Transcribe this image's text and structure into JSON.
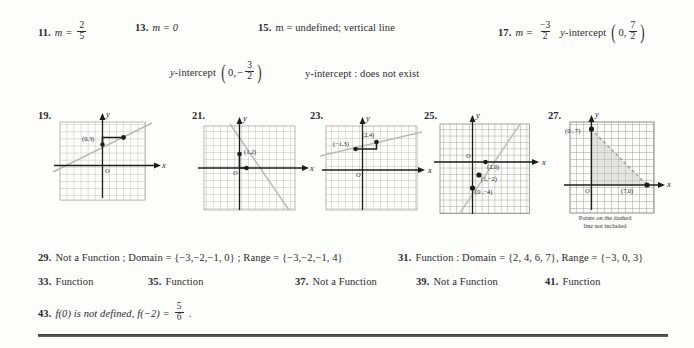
{
  "answers": {
    "row1": [
      {
        "number": "11.",
        "prefix": "m =",
        "frac": {
          "num": "2",
          "den": "5"
        }
      },
      {
        "number": "13.",
        "text": "m = 0"
      },
      {
        "number": "15.",
        "text": "m = undefined; vertical line"
      },
      {
        "number": "17.",
        "prefix": "m =",
        "frac": {
          "num": "−3",
          "den": "2"
        },
        "suffix": "y-intercept",
        "pair": {
          "x": "0,",
          "fracnum": "7",
          "fracden": "2"
        }
      }
    ],
    "row2": [
      {
        "label": "y-intercept",
        "pair": {
          "x": "0,",
          "sign": "−",
          "fracnum": "3",
          "fracden": "2"
        }
      },
      {
        "text": "y-intercept : does not exist"
      }
    ],
    "row3": [
      {
        "number": "29.",
        "text": "Not a Function ; Domain = {−3,−2,−1, 0} ; Range = {−3,−2,−1, 4}"
      },
      {
        "number": "31.",
        "text": "Function : Domain = {2, 4, 6, 7},  Range = {−3, 0, 3}"
      }
    ],
    "row4": [
      {
        "number": "33.",
        "text": "Function"
      },
      {
        "number": "35.",
        "text": "Function"
      },
      {
        "number": "37.",
        "text": "Not a Function"
      },
      {
        "number": "39.",
        "text": "Not a Function"
      },
      {
        "number": "41.",
        "text": "Function"
      }
    ],
    "row5": [
      {
        "number": "43.",
        "prefix": "f(0)  is not defined,   f(−2) =",
        "frac": {
          "num": "5",
          "den": "6"
        },
        "suffix": "."
      }
    ]
  },
  "graphs": [
    {
      "number": "19.",
      "x_axis_label": "x",
      "y_axis_label": "y",
      "origin_label": "O",
      "point_labels": [
        "(0,3)"
      ],
      "line_style": "solid",
      "shaded": false,
      "caption": ""
    },
    {
      "number": "21.",
      "x_axis_label": "x",
      "y_axis_label": "y",
      "origin_label": "O",
      "point_labels": [
        "(1,2)"
      ],
      "line_style": "solid",
      "shaded": false,
      "caption": ""
    },
    {
      "number": "23.",
      "x_axis_label": "x",
      "y_axis_label": "y",
      "origin_label": "O",
      "point_labels": [
        "(−1,3)",
        "(2,4)"
      ],
      "line_style": "solid",
      "shaded": false,
      "caption": ""
    },
    {
      "number": "25.",
      "x_axis_label": "x",
      "y_axis_label": "y",
      "origin_label": "O",
      "point_labels": [
        "(2,0)",
        "(1,−2)",
        "(0 ,−4)"
      ],
      "line_style": "solid",
      "shaded": false,
      "caption": ""
    },
    {
      "number": "27.",
      "x_axis_label": "x",
      "y_axis_label": "y",
      "origin_label": "O",
      "point_labels": [
        "(0 , 7)",
        "(7,0)"
      ],
      "line_style": "dashed",
      "shaded": true,
      "caption": "Points on the dashed\nline not included"
    }
  ],
  "colors": {
    "ink": "#2b2b2b",
    "grid": "#9a9a9a",
    "grid_dark": "#7c7c7c",
    "axis": "#1d1d1d",
    "line": "#b5b5b5",
    "shade": "#d9d9d9",
    "rule": "#3a3a3a"
  }
}
